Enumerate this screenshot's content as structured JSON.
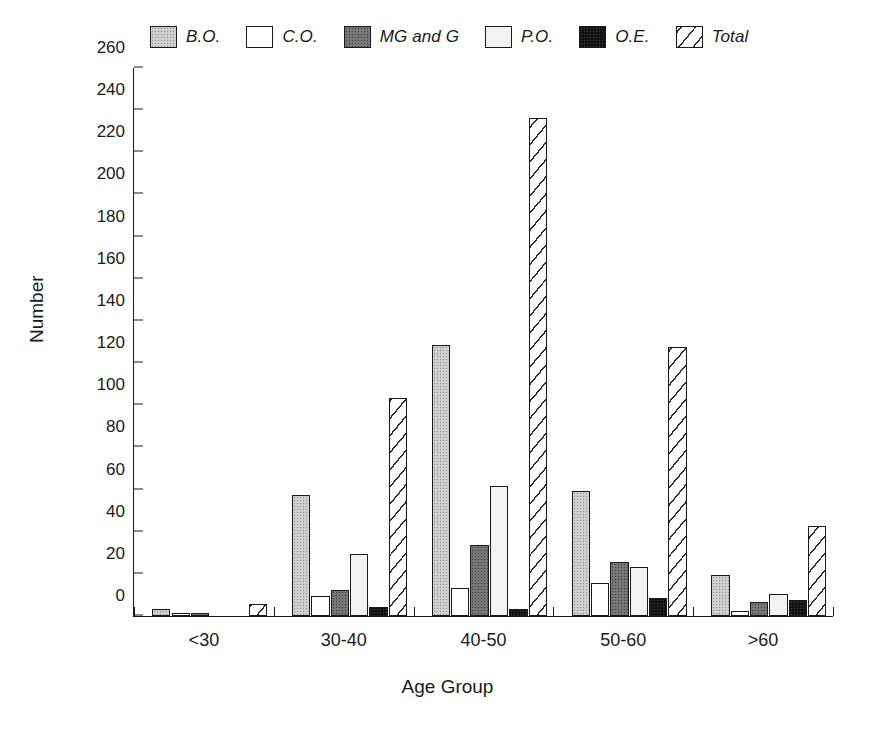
{
  "chart_data": {
    "type": "bar",
    "title": "",
    "xlabel": "Age Group",
    "ylabel": "Number",
    "categories": [
      "<30",
      "30-40",
      "40-50",
      "50-60",
      ">60"
    ],
    "ylim": [
      0,
      260
    ],
    "ytick_step": 20,
    "yticks": [
      0,
      20,
      40,
      60,
      80,
      100,
      120,
      140,
      160,
      180,
      200,
      220,
      240,
      260
    ],
    "grid": false,
    "legend_position": "top",
    "series": [
      {
        "name": "B.O.",
        "pattern": "light-gray-stipple",
        "values": [
          3,
          57,
          128,
          59,
          19
        ]
      },
      {
        "name": "C.O.",
        "pattern": "white",
        "values": [
          1,
          9,
          13,
          15,
          2
        ]
      },
      {
        "name": "MG and G",
        "pattern": "dark-gray-stipple",
        "values": [
          1,
          12,
          33,
          25,
          6
        ]
      },
      {
        "name": "P.O.",
        "pattern": "very-light-gray",
        "values": [
          0,
          29,
          61,
          23,
          10
        ]
      },
      {
        "name": "O.E.",
        "pattern": "black",
        "values": [
          0,
          4,
          3,
          8,
          7
        ]
      },
      {
        "name": "Total",
        "pattern": "diagonal-hatch",
        "values": [
          5,
          103,
          236,
          127,
          42
        ]
      }
    ]
  },
  "legend": {
    "items": [
      {
        "label": "B.O."
      },
      {
        "label": "C.O."
      },
      {
        "label": "MG and G"
      },
      {
        "label": "P.O."
      },
      {
        "label": "O.E."
      },
      {
        "label": "Total"
      }
    ]
  },
  "axes": {
    "y_title": "Number",
    "x_title": "Age Group"
  },
  "colors": {
    "axis": "#1a1a1a",
    "bo": "#cfcfcf",
    "co": "#ffffff",
    "mgg": "#777777",
    "po": "#f2f2f2",
    "oe": "#131313",
    "total": "#ffffff"
  }
}
